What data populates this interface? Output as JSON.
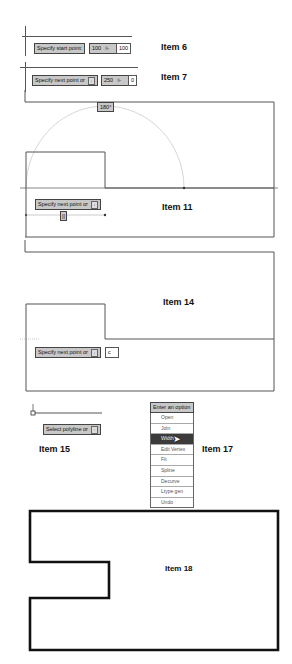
{
  "items": [
    {
      "id": "item6",
      "label": "Item 6"
    },
    {
      "id": "item7",
      "label": "Item 7"
    },
    {
      "id": "item11",
      "label": "Item 11"
    },
    {
      "id": "item14",
      "label": "Item 14"
    },
    {
      "id": "item15",
      "label": "Item 15"
    },
    {
      "id": "item17",
      "label": "Item 17"
    },
    {
      "id": "item18",
      "label": "Item 18"
    }
  ],
  "item6": {
    "prompt": "Specify start point:",
    "x_value": "100",
    "y_value": "100"
  },
  "item7": {
    "prompt": "Specify next point or",
    "length_value": "250",
    "angle_value": "0"
  },
  "item11": {
    "angle_tooltip": "180°",
    "prompt": "Specify next point or",
    "length_value": "||"
  },
  "item14": {
    "prompt": "Specify next point or",
    "input_value": "c"
  },
  "item15": {
    "prompt": "Select polyline or"
  },
  "item17": {
    "menu_title": "Enter an option",
    "options": [
      "Open",
      "Join",
      "Width",
      "Edit Vertex",
      "Fit",
      "Spline",
      "Decurve",
      "Ltype gen",
      "Undo"
    ],
    "selected": "Width"
  },
  "colors": {
    "prompt_bg": "#c8c8c8",
    "menu_highlight": "#3b3b3b",
    "line": "#555555",
    "polyline_thick": "#111111"
  }
}
